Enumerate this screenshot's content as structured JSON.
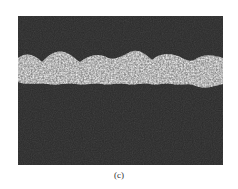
{
  "figure": {
    "label": "(c)",
    "colors": {
      "background": "#2b2b2b",
      "band": "#bdbdbd"
    }
  }
}
